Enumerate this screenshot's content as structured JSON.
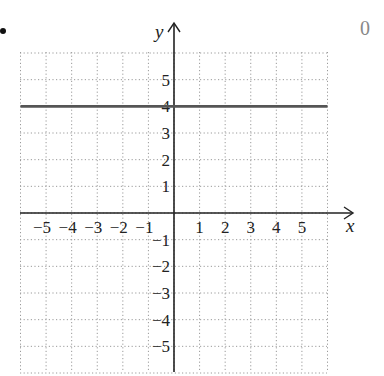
{
  "problem": {
    "bullet": "•",
    "corner_label": "0"
  },
  "chart_data": {
    "type": "line",
    "title": "",
    "xlabel": "x",
    "ylabel": "y",
    "xlim": [
      -6,
      6
    ],
    "ylim": [
      -6,
      6
    ],
    "grid": true,
    "grid_style": "dotted",
    "x_ticks": [
      -5,
      -4,
      -3,
      -2,
      -1,
      1,
      2,
      3,
      4,
      5
    ],
    "x_tick_labels": [
      "−5",
      "−4",
      "−3",
      "−2",
      "−1",
      "1",
      "2",
      "3",
      "4",
      "5"
    ],
    "y_ticks": [
      5,
      4,
      3,
      2,
      1,
      -1,
      -2,
      -3,
      -4,
      -5
    ],
    "y_tick_labels": [
      "5",
      "4",
      "3",
      "2",
      "1",
      "−1",
      "−2",
      "−3",
      "−4",
      "−5"
    ],
    "series": [
      {
        "name": "y = 4",
        "x": [
          -6,
          6
        ],
        "y": [
          4,
          4
        ],
        "color": "#555555"
      }
    ]
  }
}
